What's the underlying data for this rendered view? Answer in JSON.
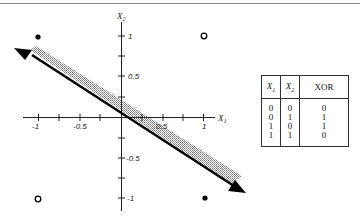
{
  "diagram": {
    "axes": {
      "x_label": "X",
      "x_label_sub": "1",
      "y_label": "X",
      "y_label_sub": "2",
      "x_tick_labels": [
        "-1",
        "-0.5",
        "0.5",
        "1"
      ],
      "y_tick_labels": [
        "1",
        "0.5",
        "-0.5",
        "-1"
      ]
    },
    "points": [
      {
        "x": 0,
        "y": 1,
        "style": "filled",
        "class": 1
      },
      {
        "x": 1,
        "y": 1,
        "style": "open",
        "class": 0
      },
      {
        "x": 0,
        "y": 0,
        "style": "open",
        "class": 0
      },
      {
        "x": 1,
        "y": 0,
        "style": "filled",
        "class": 1
      }
    ],
    "decision_line": {
      "description": "double-headed arrow line through origin, shaded band above",
      "slope": -0.53
    }
  },
  "table": {
    "headers": {
      "x1": "X",
      "x1_sub": "1",
      "x2": "X",
      "x2_sub": "2",
      "out": "XOR"
    },
    "rows": [
      {
        "x1": "0",
        "x2": "0",
        "xor": "0"
      },
      {
        "x1": "0",
        "x2": "1",
        "xor": "1"
      },
      {
        "x1": "1",
        "x2": "0",
        "xor": "1"
      },
      {
        "x1": "1",
        "x2": "1",
        "xor": "0"
      }
    ]
  }
}
